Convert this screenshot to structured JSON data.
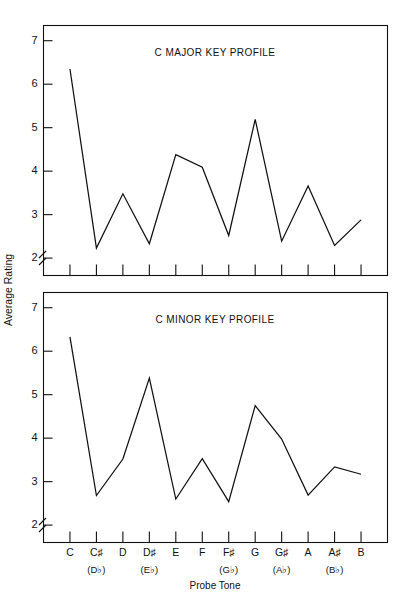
{
  "figure": {
    "y_axis_label": "Average Rating",
    "x_axis_label": "Probe Tone",
    "axis_break": true,
    "line_color": "#111111",
    "background_color": "#ffffff"
  },
  "chart_data": [
    {
      "type": "line",
      "title": "C MAJOR KEY PROFILE",
      "xlabel": "Probe Tone",
      "ylabel": "Average Rating",
      "categories": [
        "C",
        "C♯",
        "D",
        "D♯",
        "E",
        "F",
        "F♯",
        "G",
        "G♯",
        "A",
        "A♯",
        "B"
      ],
      "categories_alt": [
        "",
        "(D♭)",
        "",
        "(E♭)",
        "",
        "",
        "(G♭)",
        "",
        "(A♭)",
        "",
        "(B♭)",
        ""
      ],
      "values": [
        6.35,
        2.23,
        3.48,
        2.33,
        4.38,
        4.09,
        2.52,
        5.19,
        2.39,
        3.66,
        2.29,
        2.88
      ],
      "ylim": [
        1.6,
        7.35
      ],
      "yticks": [
        2,
        3,
        4,
        5,
        6,
        7
      ],
      "ytick_labels": [
        "2",
        "3",
        "4",
        "5",
        "6",
        "7"
      ],
      "grid": false,
      "legend": "none"
    },
    {
      "type": "line",
      "title": "C MINOR KEY PROFILE",
      "xlabel": "Probe Tone",
      "ylabel": "Average Rating",
      "categories": [
        "C",
        "C♯",
        "D",
        "D♯",
        "E",
        "F",
        "F♯",
        "G",
        "G♯",
        "A",
        "A♯",
        "B"
      ],
      "categories_alt": [
        "",
        "(D♭)",
        "",
        "(E♭)",
        "",
        "",
        "(G♭)",
        "",
        "(A♭)",
        "",
        "(B♭)",
        ""
      ],
      "values": [
        6.33,
        2.68,
        3.52,
        5.38,
        2.6,
        3.53,
        2.54,
        4.75,
        3.98,
        2.69,
        3.34,
        3.17
      ],
      "ylim": [
        1.6,
        7.35
      ],
      "yticks": [
        2,
        3,
        4,
        5,
        6,
        7
      ],
      "ytick_labels": [
        "2",
        "3",
        "4",
        "5",
        "6",
        "7"
      ],
      "grid": false,
      "legend": "none"
    }
  ]
}
